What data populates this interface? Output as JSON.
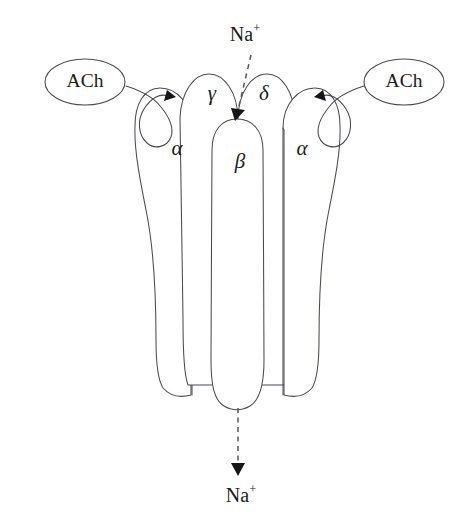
{
  "figure": {
    "background_color": "#ffffff",
    "line_color": "#4a4a52",
    "text_color": "#1b1b20"
  },
  "ligands": [
    {
      "id": "ach-left",
      "label": "ACh",
      "side": "left"
    },
    {
      "id": "ach-right",
      "label": "ACh",
      "side": "right"
    }
  ],
  "subunits": [
    {
      "id": "subunit-alpha-left",
      "label": "α",
      "name": "alpha",
      "position": "outer-left"
    },
    {
      "id": "subunit-gamma",
      "label": "γ",
      "name": "gamma",
      "position": "inner-left"
    },
    {
      "id": "subunit-beta",
      "label": "β",
      "name": "beta",
      "position": "center"
    },
    {
      "id": "subunit-delta",
      "label": "δ",
      "name": "delta",
      "position": "inner-right"
    },
    {
      "id": "subunit-alpha-right",
      "label": "α",
      "name": "alpha",
      "position": "outer-right"
    }
  ],
  "ions": {
    "top": {
      "symbol": "Na",
      "charge": "+",
      "label": "Na⁺",
      "direction": "into-channel"
    },
    "bottom": {
      "symbol": "Na",
      "charge": "+",
      "label": "Na⁺",
      "direction": "out-of-channel"
    }
  },
  "binding_sites": [
    {
      "id": "binding-site-left",
      "subunit": "α"
    },
    {
      "id": "binding-site-right",
      "subunit": "α"
    }
  ]
}
